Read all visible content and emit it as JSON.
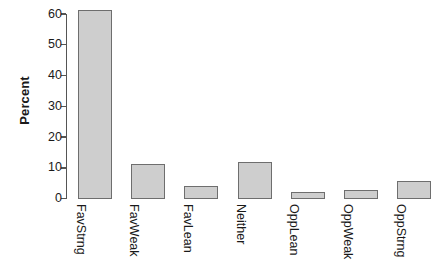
{
  "chart_data": {
    "type": "bar",
    "title": "",
    "subtitle": "",
    "xlabel": "",
    "ylabel": "Percent",
    "categories": [
      "FavStrng",
      "FavWeak",
      "FavLean",
      "Neither",
      "OppLean",
      "OppWeak",
      "OppStrng"
    ],
    "values": [
      61.5,
      11.4,
      4.1,
      11.9,
      2.2,
      2.9,
      5.7
    ],
    "ylim": [
      0,
      60
    ],
    "yticks": [
      0,
      10,
      20,
      30,
      40,
      50,
      60
    ],
    "ytick_labels": [
      "0",
      "10",
      "20",
      "30",
      "40",
      "50",
      "60"
    ],
    "grid": false,
    "legend": false,
    "legend_position": "none",
    "bar_fill_color": "#cecece",
    "bar_border_color": "#6e6e6e",
    "axis_color": "#555555",
    "background_color": "#ffffff",
    "text_color": "#1a1a1a"
  }
}
